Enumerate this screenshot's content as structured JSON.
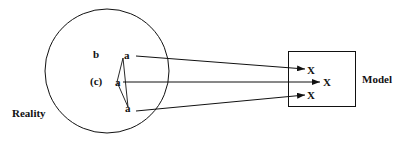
{
  "diagram": {
    "reality_label": "Reality",
    "model_label": "Model",
    "inner_labels": {
      "b": "b",
      "c": "(c)",
      "a_top": "a",
      "a_middle": "a",
      "a_bottom": "a"
    },
    "model_points": {
      "x_top": "X",
      "x_middle": "X",
      "x_bottom": "X"
    },
    "colors": {
      "stroke": "#111111",
      "background": "#ffffff"
    }
  }
}
